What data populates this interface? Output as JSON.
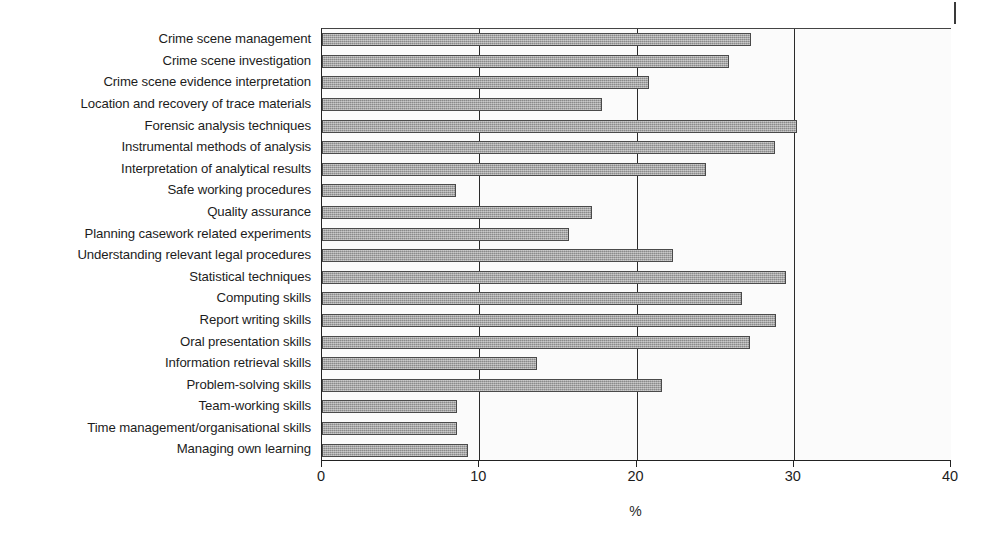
{
  "chart_data": {
    "type": "bar",
    "orientation": "horizontal",
    "title": "",
    "xlabel": "%",
    "ylabel": "",
    "xlim": [
      0,
      40
    ],
    "xticks": [
      0,
      10,
      20,
      30,
      40
    ],
    "xtick_labels": [
      "0",
      "10",
      "20",
      "30",
      "40"
    ],
    "grid": "vertical gridlines at 10, 20, 30",
    "legend": "none",
    "bar_color": "#9d9d9d",
    "bar_edge_color": "#4a4a4a",
    "categories": [
      "Crime scene management",
      "Crime scene investigation",
      "Crime scene evidence interpretation",
      "Location and recovery of trace materials",
      "Forensic analysis techniques",
      "Instrumental methods of analysis",
      "Interpretation of analytical results",
      "Safe working procedures",
      "Quality assurance",
      "Planning casework related experiments",
      "Understanding relevant legal procedures",
      "Statistical techniques",
      "Computing skills",
      "Report writing skills",
      "Oral presentation skills",
      "Information retrieval skills",
      "Problem-solving skills",
      "Team-working skills",
      "Time management/organisational skills",
      "Managing own learning"
    ],
    "values": [
      27.3,
      25.9,
      20.8,
      17.8,
      30.2,
      28.8,
      24.4,
      8.5,
      17.2,
      15.7,
      22.3,
      29.5,
      26.7,
      28.9,
      27.2,
      13.7,
      21.6,
      8.6,
      8.6,
      9.3
    ]
  }
}
